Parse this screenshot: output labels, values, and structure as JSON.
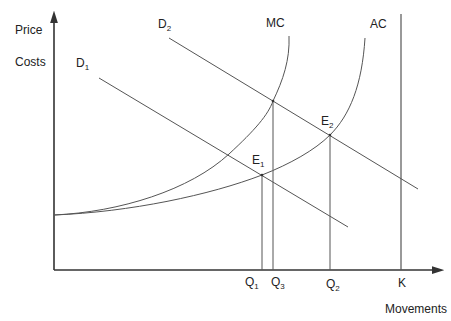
{
  "diagram": {
    "y_axis_labels": [
      "Price",
      "Costs"
    ],
    "x_axis_label": "Movements",
    "curves": {
      "mc": "MC",
      "ac": "AC",
      "d1": {
        "base": "D",
        "sub": "1"
      },
      "d2": {
        "base": "D",
        "sub": "2"
      }
    },
    "points": {
      "e1": {
        "base": "E",
        "sub": "1"
      },
      "e2": {
        "base": "E",
        "sub": "2"
      }
    },
    "x_ticks": {
      "q1": {
        "base": "Q",
        "sub": "1"
      },
      "q3": {
        "base": "Q",
        "sub": "3"
      },
      "q2": {
        "base": "Q",
        "sub": "2"
      },
      "k": "K"
    },
    "colors": {
      "axis": "#333333",
      "line": "#555555",
      "text": "#222222"
    }
  }
}
